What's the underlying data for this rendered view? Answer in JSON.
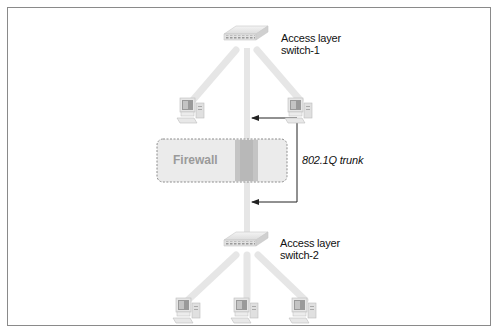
{
  "diagram": {
    "nodes": {
      "switch1": {
        "label_line1": "Access layer",
        "label_line2": "switch-1"
      },
      "switch2": {
        "label_line1": "Access layer",
        "label_line2": "switch-2"
      },
      "firewall": {
        "label": "Firewall"
      }
    },
    "link_label": "802.1Q trunk",
    "computers": {
      "top_count": 2,
      "bottom_count": 3
    },
    "colors": {
      "frame": "#8a8a8a",
      "link": "#e6e6e6",
      "firewall_fill": "#ebebeb",
      "firewall_border": "#8c8c8c",
      "firewall_label": "#9a9a9a",
      "arrow": "#222222"
    }
  }
}
